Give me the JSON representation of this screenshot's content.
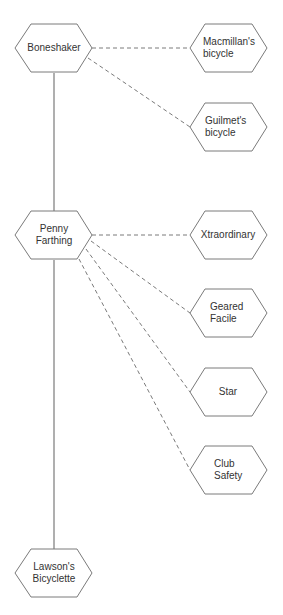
{
  "diagram": {
    "type": "hierarchy",
    "edge_styles": {
      "solid": "main lineage",
      "dashed": "variant / derivative"
    },
    "colors": {
      "stroke": "#7a7a7a",
      "text": "#333333",
      "background": "#ffffff"
    },
    "main_nodes": [
      {
        "id": "boneshaker",
        "lines": [
          "Boneshaker"
        ]
      },
      {
        "id": "penny-farthing",
        "lines": [
          "Penny",
          "Farthing"
        ]
      },
      {
        "id": "lawsons-bicyclette",
        "lines": [
          "Lawson's",
          "Bicyclette"
        ]
      }
    ],
    "branch_nodes": [
      {
        "id": "macmillans-bicycle",
        "parent": "boneshaker",
        "lines": [
          "Macmillan's",
          "bicycle"
        ]
      },
      {
        "id": "guilmets-bicycle",
        "parent": "boneshaker",
        "lines": [
          "Guilmet's",
          "bicycle"
        ]
      },
      {
        "id": "xtraordinary",
        "parent": "penny-farthing",
        "lines": [
          "Xtraordinary"
        ]
      },
      {
        "id": "geared-facile",
        "parent": "penny-farthing",
        "lines": [
          "Geared",
          "Facile"
        ]
      },
      {
        "id": "star",
        "parent": "penny-farthing",
        "lines": [
          "Star"
        ]
      },
      {
        "id": "club-safety",
        "parent": "penny-farthing",
        "lines": [
          "Club",
          "Safety"
        ]
      }
    ],
    "edges": [
      {
        "from": "boneshaker",
        "to": "penny-farthing",
        "style": "solid"
      },
      {
        "from": "penny-farthing",
        "to": "lawsons-bicyclette",
        "style": "solid"
      },
      {
        "from": "boneshaker",
        "to": "macmillans-bicycle",
        "style": "dashed"
      },
      {
        "from": "boneshaker",
        "to": "guilmets-bicycle",
        "style": "dashed"
      },
      {
        "from": "penny-farthing",
        "to": "xtraordinary",
        "style": "dashed"
      },
      {
        "from": "penny-farthing",
        "to": "geared-facile",
        "style": "dashed"
      },
      {
        "from": "penny-farthing",
        "to": "star",
        "style": "dashed"
      },
      {
        "from": "penny-farthing",
        "to": "club-safety",
        "style": "dashed"
      }
    ]
  }
}
